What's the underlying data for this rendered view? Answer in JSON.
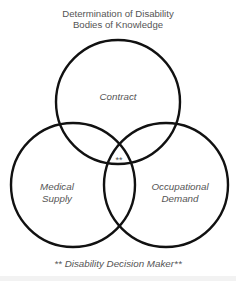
{
  "diagram": {
    "title_line1": "Determination of Disability",
    "title_line2": "Bodies of Knowledge",
    "type": "venn",
    "circles": [
      {
        "id": "contract",
        "label": "Contract",
        "cx": 118,
        "cy": 102,
        "r": 62
      },
      {
        "id": "medical-supply",
        "label_line1": "Medical",
        "label_line2": "Supply",
        "cx": 73,
        "cy": 185,
        "r": 62
      },
      {
        "id": "occupational-demand",
        "label_line1": "Occupational",
        "label_line2": "Demand",
        "cx": 166,
        "cy": 185,
        "r": 62
      }
    ],
    "center_marker": "**",
    "footnote": "** Disability Decision Maker**",
    "stroke_color": "#111111"
  }
}
